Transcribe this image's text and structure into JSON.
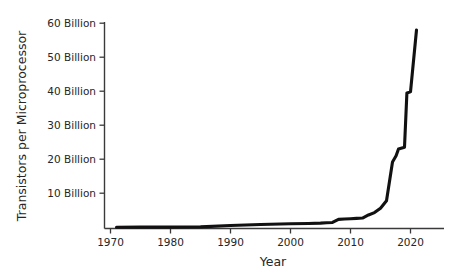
{
  "chart_data": {
    "type": "line",
    "title": "",
    "xlabel": "Year",
    "ylabel": "Transistors per Microprocessor",
    "xlim": [
      1965,
      1975.5
    ],
    "xlim_actual": [
      1966,
      2024
    ],
    "ylim": [
      0,
      63
    ],
    "grid": false,
    "legend": "none",
    "x_tick_labels": [
      "1970",
      "1980",
      "1990",
      "2000",
      "2010",
      "2020"
    ],
    "x_ticks": [
      1970,
      1980,
      1990,
      2000,
      2010,
      2020
    ],
    "y_tick_labels": [
      "10 Billion",
      "20 Billion",
      "30 Billion",
      "40 Billion",
      "50 Billion",
      "60 Billion"
    ],
    "y_ticks": [
      10,
      20,
      30,
      40,
      50,
      60
    ],
    "y_unit": "Billion",
    "series": [
      {
        "name": "Transistors per Microprocessor",
        "color": "#111111",
        "x": [
          1971,
          1975,
          1980,
          1985,
          1990,
          1995,
          2000,
          2003,
          2005,
          2006,
          2007,
          2008,
          2009,
          2010,
          2011,
          2012,
          2013,
          2014,
          2015,
          2016,
          2017,
          2017.6,
          2018,
          2019,
          2019.4,
          2020,
          2021
        ],
        "values": [
          0.0,
          0.01,
          0.03,
          0.1,
          0.5,
          0.8,
          1.0,
          1.1,
          1.2,
          1.3,
          1.4,
          2.3,
          2.4,
          2.5,
          2.6,
          2.7,
          3.6,
          4.3,
          5.6,
          7.8,
          19.2,
          21.0,
          23.0,
          23.5,
          39.5,
          39.8,
          58.0
        ]
      }
    ]
  },
  "axes": {
    "x_axis_title": "Year",
    "y_axis_title": "Transistors per Microprocessor"
  }
}
